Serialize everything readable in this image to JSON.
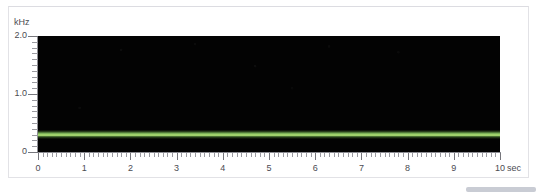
{
  "chart_data": {
    "type": "line",
    "title": "",
    "subtitle": "",
    "xlabel": "sec",
    "ylabel": "kHz",
    "xlim": [
      0,
      10
    ],
    "ylim": [
      0,
      2.0
    ],
    "grid": false,
    "legend": "none",
    "background_color": "#030303",
    "trace_color": "#9ed06b",
    "x_tick_labels": [
      "0",
      "1",
      "2",
      "3",
      "4",
      "5",
      "6",
      "7",
      "8",
      "9",
      "10"
    ],
    "x_tick_values": [
      0,
      1,
      2,
      3,
      4,
      5,
      6,
      7,
      8,
      9,
      10
    ],
    "x_minor_tick_step": 0.1,
    "y_tick_labels": [
      "2.0",
      "1.0",
      "0"
    ],
    "y_tick_values": [
      2.0,
      1.0,
      0
    ],
    "y_minor_tick_step": 0.1,
    "series": [
      {
        "name": "fundamental frequency",
        "description": "steady horizontal green band",
        "x": [
          0,
          1,
          2,
          3,
          4,
          5,
          6,
          7,
          8,
          9,
          10
        ],
        "values": [
          0.3,
          0.3,
          0.3,
          0.3,
          0.3,
          0.3,
          0.3,
          0.3,
          0.3,
          0.3,
          0.3
        ]
      }
    ],
    "annotations": []
  },
  "axes": {
    "y_unit_label": "kHz",
    "x_unit_label": "sec"
  }
}
